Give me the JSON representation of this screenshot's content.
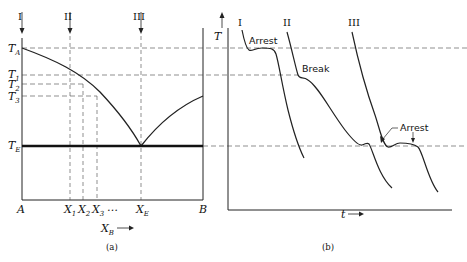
{
  "panel_a": {
    "caption": "(a)",
    "compositions": [
      "I",
      "II",
      "III"
    ],
    "temperature_labels": [
      {
        "main": "T",
        "sub": "A"
      },
      {
        "main": "T",
        "sub": "1"
      },
      {
        "main": "T",
        "sub": "2"
      },
      {
        "main": "T",
        "sub": "3"
      },
      {
        "main": "T",
        "sub": "E"
      }
    ],
    "x_labels": [
      {
        "main": "A",
        "sub": ""
      },
      {
        "main": "X",
        "sub": "1"
      },
      {
        "main": "X",
        "sub": "2"
      },
      {
        "main": "X",
        "sub": "3"
      },
      {
        "main": "…",
        "sub": ""
      },
      {
        "main": "X",
        "sub": "E"
      },
      {
        "main": "B",
        "sub": ""
      }
    ],
    "x_axis_label": {
      "main": "X",
      "sub": "B"
    }
  },
  "panel_b": {
    "caption": "(b)",
    "y_axis_label": "T",
    "x_axis_label": "t",
    "curves": [
      "I",
      "II",
      "III"
    ],
    "annotations": [
      "Arrest",
      "Break",
      "Arrest"
    ]
  }
}
